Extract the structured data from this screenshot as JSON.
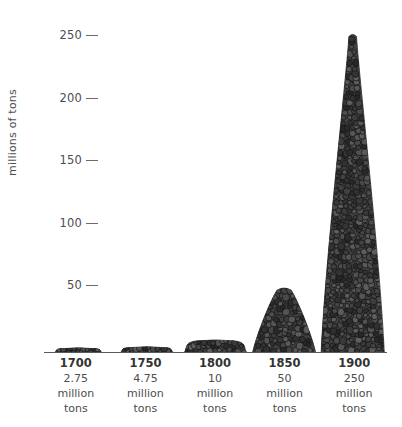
{
  "chart_data": {
    "type": "bar",
    "title": "",
    "subtitle": "",
    "xlabel": "",
    "ylabel": "millions of tons",
    "categories": [
      "1700",
      "1750",
      "1800",
      "1850",
      "1900"
    ],
    "values": [
      2.75,
      4.75,
      10,
      50,
      250
    ],
    "value_labels": [
      "2.75",
      "4.75",
      "10",
      "50",
      "250"
    ],
    "unit_label_line1": "million",
    "unit_label_line2": "tons",
    "ylim": [
      0,
      260
    ],
    "yticks": [
      50,
      100,
      150,
      200,
      250
    ],
    "ytick_labels": [
      "50",
      "100",
      "150",
      "200",
      "250"
    ],
    "grid": false,
    "legend": null,
    "series_color": "#3a3a3a",
    "axis_color": "#6b6b6b",
    "background": "#ffffff",
    "annotation": "Each bar is drawn as a pile of coal lumps whose height is proportional to the value."
  },
  "axis": {
    "ylabel": "millions of tons"
  },
  "yticks": [
    {
      "label": "250"
    },
    {
      "label": "200"
    },
    {
      "label": "150"
    },
    {
      "label": "100"
    },
    {
      "label": "50"
    }
  ],
  "xcolumns": [
    {
      "year": "1700",
      "amount": "2.75",
      "unit1": "million",
      "unit2": "tons"
    },
    {
      "year": "1750",
      "amount": "4.75",
      "unit1": "million",
      "unit2": "tons"
    },
    {
      "year": "1800",
      "amount": "10",
      "unit1": "million",
      "unit2": "tons"
    },
    {
      "year": "1850",
      "amount": "50",
      "unit1": "million",
      "unit2": "tons"
    },
    {
      "year": "1900",
      "amount": "250",
      "unit1": "million",
      "unit2": "tons"
    }
  ]
}
